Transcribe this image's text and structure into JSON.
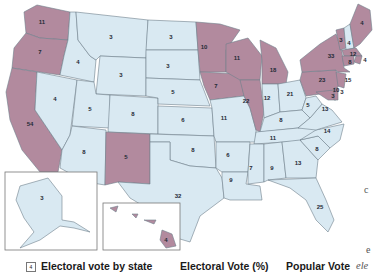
{
  "colors": {
    "democrat_fill": "#b28a9e",
    "republican_fill": "#d9e9f2",
    "border": "#6f7f8c",
    "label": "#1f2a36"
  },
  "states": [
    {
      "id": "WA",
      "votes": "11",
      "party": "red"
    },
    {
      "id": "OR",
      "votes": "7",
      "party": "red"
    },
    {
      "id": "CA",
      "votes": "54",
      "party": "red"
    },
    {
      "id": "ID",
      "votes": "4",
      "party": "blue"
    },
    {
      "id": "NV",
      "votes": "4",
      "party": "blue"
    },
    {
      "id": "MT",
      "votes": "3",
      "party": "blue"
    },
    {
      "id": "WY",
      "votes": "3",
      "party": "blue"
    },
    {
      "id": "UT",
      "votes": "5",
      "party": "blue"
    },
    {
      "id": "AZ",
      "votes": "8",
      "party": "blue"
    },
    {
      "id": "CO",
      "votes": "8",
      "party": "blue"
    },
    {
      "id": "NM",
      "votes": "5",
      "party": "red"
    },
    {
      "id": "ND",
      "votes": "3",
      "party": "blue"
    },
    {
      "id": "SD",
      "votes": "3",
      "party": "blue"
    },
    {
      "id": "NE",
      "votes": "5",
      "party": "blue"
    },
    {
      "id": "KS",
      "votes": "6",
      "party": "blue"
    },
    {
      "id": "OK",
      "votes": "8",
      "party": "blue"
    },
    {
      "id": "TX",
      "votes": "32",
      "party": "blue"
    },
    {
      "id": "MN",
      "votes": "10",
      "party": "red"
    },
    {
      "id": "IA",
      "votes": "7",
      "party": "red"
    },
    {
      "id": "MO",
      "votes": "11",
      "party": "blue"
    },
    {
      "id": "AR",
      "votes": "6",
      "party": "blue"
    },
    {
      "id": "LA",
      "votes": "9",
      "party": "blue"
    },
    {
      "id": "WI",
      "votes": "11",
      "party": "red"
    },
    {
      "id": "IL",
      "votes": "22",
      "party": "red"
    },
    {
      "id": "MI",
      "votes": "18",
      "party": "red"
    },
    {
      "id": "IN",
      "votes": "12",
      "party": "blue"
    },
    {
      "id": "OH",
      "votes": "21",
      "party": "blue"
    },
    {
      "id": "KY",
      "votes": "8",
      "party": "blue"
    },
    {
      "id": "TN",
      "votes": "11",
      "party": "blue"
    },
    {
      "id": "MS",
      "votes": "7",
      "party": "blue"
    },
    {
      "id": "AL",
      "votes": "9",
      "party": "blue"
    },
    {
      "id": "GA",
      "votes": "13",
      "party": "blue"
    },
    {
      "id": "FL",
      "votes": "25",
      "party": "blue"
    },
    {
      "id": "SC",
      "votes": "8",
      "party": "blue"
    },
    {
      "id": "NC",
      "votes": "14",
      "party": "blue"
    },
    {
      "id": "VA",
      "votes": "13",
      "party": "blue"
    },
    {
      "id": "WV",
      "votes": "5",
      "party": "blue"
    },
    {
      "id": "PA",
      "votes": "23",
      "party": "red"
    },
    {
      "id": "NY",
      "votes": "33",
      "party": "red"
    },
    {
      "id": "VT",
      "votes": "3",
      "party": "red"
    },
    {
      "id": "NH",
      "votes": "4",
      "party": "blue"
    },
    {
      "id": "ME",
      "votes": "4",
      "party": "red"
    },
    {
      "id": "MA",
      "votes": "12",
      "party": "red"
    },
    {
      "id": "RI",
      "votes": "4",
      "party": "red"
    },
    {
      "id": "CT",
      "votes": "8",
      "party": "red"
    },
    {
      "id": "NJ",
      "votes": "15",
      "party": "red"
    },
    {
      "id": "MD",
      "votes": "10",
      "party": "red"
    },
    {
      "id": "DE",
      "votes": "3",
      "party": "red"
    },
    {
      "id": "DC",
      "votes": "3",
      "party": "red"
    },
    {
      "id": "AK",
      "votes": "3",
      "party": "blue"
    },
    {
      "id": "HI",
      "votes": "4",
      "party": "red"
    }
  ],
  "legend": {
    "box_sample": "4",
    "electoral_by_state": "Electoral vote by state",
    "electoral_pct": "Electoral Vote (%)",
    "popular_vote": "Popular Vote"
  },
  "side_fragments": {
    "c1": "c",
    "c2": "e",
    "ele": "ele"
  }
}
